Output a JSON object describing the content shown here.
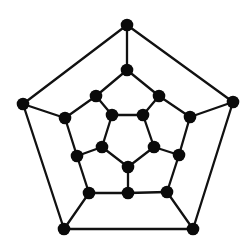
{
  "diagram": {
    "type": "graph",
    "name": "dodecahedron graph (planar Schlegel embedding)",
    "colors": {
      "background": "#ffffff",
      "edge": "#111111",
      "node": "#0a0a0a"
    },
    "node_radius": 6.3,
    "nodes": [
      {
        "id": 0,
        "x": 127,
        "y": 25
      },
      {
        "id": 1,
        "x": 233,
        "y": 102
      },
      {
        "id": 2,
        "x": 193,
        "y": 229
      },
      {
        "id": 3,
        "x": 64,
        "y": 229
      },
      {
        "id": 4,
        "x": 23,
        "y": 104
      },
      {
        "id": 5,
        "x": 127,
        "y": 70
      },
      {
        "id": 6,
        "x": 159,
        "y": 96
      },
      {
        "id": 7,
        "x": 190,
        "y": 117
      },
      {
        "id": 8,
        "x": 179,
        "y": 155
      },
      {
        "id": 9,
        "x": 167,
        "y": 192
      },
      {
        "id": 10,
        "x": 128,
        "y": 193
      },
      {
        "id": 11,
        "x": 89,
        "y": 193
      },
      {
        "id": 12,
        "x": 77,
        "y": 156
      },
      {
        "id": 13,
        "x": 65,
        "y": 118
      },
      {
        "id": 14,
        "x": 96,
        "y": 96
      },
      {
        "id": 15,
        "x": 112,
        "y": 115
      },
      {
        "id": 16,
        "x": 143,
        "y": 115
      },
      {
        "id": 17,
        "x": 154,
        "y": 147
      },
      {
        "id": 18,
        "x": 128,
        "y": 167
      },
      {
        "id": 19,
        "x": 102,
        "y": 147
      }
    ],
    "edges": [
      [
        0,
        1
      ],
      [
        1,
        2
      ],
      [
        2,
        3
      ],
      [
        3,
        4
      ],
      [
        4,
        0
      ],
      [
        0,
        5
      ],
      [
        1,
        7
      ],
      [
        2,
        9
      ],
      [
        3,
        11
      ],
      [
        4,
        13
      ],
      [
        5,
        6
      ],
      [
        6,
        7
      ],
      [
        7,
        8
      ],
      [
        8,
        9
      ],
      [
        9,
        10
      ],
      [
        10,
        11
      ],
      [
        11,
        12
      ],
      [
        12,
        13
      ],
      [
        13,
        14
      ],
      [
        14,
        5
      ],
      [
        14,
        15
      ],
      [
        6,
        16
      ],
      [
        8,
        17
      ],
      [
        10,
        18
      ],
      [
        12,
        19
      ],
      [
        15,
        16
      ],
      [
        16,
        17
      ],
      [
        17,
        18
      ],
      [
        18,
        19
      ],
      [
        19,
        15
      ]
    ]
  }
}
